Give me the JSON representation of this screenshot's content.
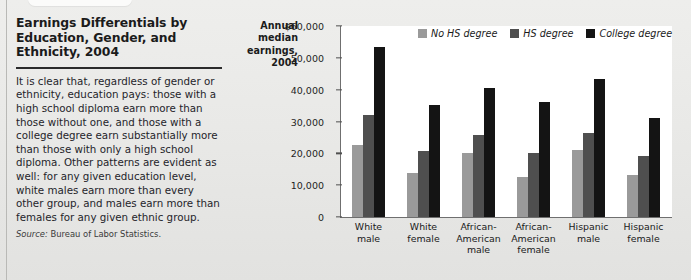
{
  "panel": {
    "title": "Earnings Differentials by Education, Gender, and Ethnicity, 2004",
    "body": "It is clear that, regardless of gender or ethnicity, education pays: those with a high school diploma earn more than those without one, and those with a college degree earn substantially more than those with only a high school diploma. Other patterns are evident as well: for any given education level, white males earn more than every other group, and males earn more than females for any given ethnic group.",
    "source_label": "Source:",
    "source_text": "Bureau of Labor Statistics."
  },
  "chart_data": {
    "type": "bar",
    "title": "",
    "ylabel": "Annual median earnings, 2004",
    "xlabel": "",
    "ylim": [
      0,
      60000
    ],
    "grid": false,
    "legend_position": "top-right",
    "ytick_labels": [
      "$60,000",
      "50,000",
      "40,000",
      "30,000",
      "20,000",
      "10,000",
      "0"
    ],
    "ytick_values": [
      60000,
      50000,
      40000,
      30000,
      20000,
      10000,
      0
    ],
    "categories": [
      "White male",
      "White female",
      "African-American male",
      "African-American female",
      "Hispanic male",
      "Hispanic female"
    ],
    "category_lines": [
      [
        "White",
        "male"
      ],
      [
        "White",
        "female"
      ],
      [
        "African-",
        "American",
        "male"
      ],
      [
        "African-",
        "American",
        "female"
      ],
      [
        "Hispanic",
        "male"
      ],
      [
        "Hispanic",
        "female"
      ]
    ],
    "series": [
      {
        "name": "No HS degree",
        "color": "#9a9a9a",
        "values": [
          22500,
          13800,
          20000,
          12600,
          21000,
          13200
        ]
      },
      {
        "name": "HS degree",
        "color": "#4f4f4f",
        "values": [
          32000,
          20800,
          25800,
          20200,
          26300,
          19100
        ]
      },
      {
        "name": "College degree",
        "color": "#141414",
        "values": [
          53500,
          35200,
          40400,
          36000,
          43300,
          31100
        ]
      }
    ]
  }
}
